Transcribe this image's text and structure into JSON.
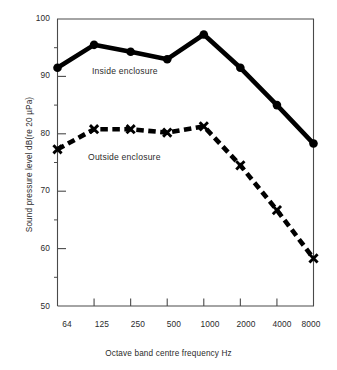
{
  "chart_data": {
    "type": "line",
    "title": "",
    "xlabel": "Octave band centre frequency Hz",
    "ylabel": "Sound pressure level dB(re 20 µPa)",
    "x": [
      64,
      125,
      250,
      500,
      1000,
      2000,
      4000,
      8000
    ],
    "xtick_labels": [
      "64",
      "125",
      "250",
      "500",
      "1000",
      "2000",
      "4000",
      "8000"
    ],
    "xscale": "log (octave bands, evenly spaced)",
    "ylim": [
      50,
      100
    ],
    "ytick_labels": [
      "50",
      "60",
      "70",
      "80",
      "90",
      "100"
    ],
    "yticks": [
      50,
      60,
      70,
      80,
      90,
      100
    ],
    "yminor_ticks": [
      55,
      65,
      75,
      85,
      95
    ],
    "grid": false,
    "legend_position": "in-plot annotations",
    "series": [
      {
        "name": "Inside enclosure",
        "marker": "filled-circle",
        "linestyle": "solid",
        "color": "#000000",
        "values": [
          91.5,
          95.5,
          94.3,
          93.0,
          97.3,
          91.5,
          85.0,
          78.3
        ]
      },
      {
        "name": "Outside enclosure",
        "marker": "x",
        "linestyle": "dashed",
        "color": "#000000",
        "values": [
          77.3,
          80.8,
          80.8,
          80.2,
          81.3,
          74.5,
          66.7,
          58.3
        ]
      }
    ],
    "annotations": [
      {
        "text": "Inside enclosure",
        "x": 250,
        "y": 89.5
      },
      {
        "text": "Outside enclosure",
        "x": 250,
        "y": 74.5
      }
    ]
  },
  "axes": {
    "y_title": "Sound pressure level dB(re 20 µPa)",
    "x_title": "Octave band centre frequency Hz",
    "y_labels": [
      "100",
      "90",
      "80",
      "70",
      "60",
      "50"
    ],
    "x_labels": [
      "64",
      "125",
      "250",
      "500",
      "1000",
      "2000",
      "4000",
      "8000"
    ]
  },
  "annotations": {
    "inside": "Inside enclosure",
    "outside": "Outside enclosure"
  },
  "colors": {
    "ink": "#000000",
    "frame": "#4a4a4a",
    "text": "#2b2b2b",
    "background": "#ffffff"
  }
}
